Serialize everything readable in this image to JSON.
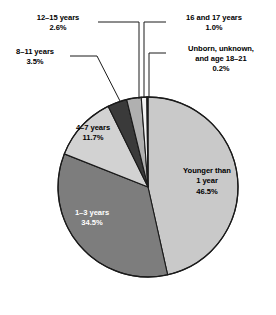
{
  "chart_data": {
    "type": "pie",
    "title": "",
    "subtitle": "",
    "xlabel": "",
    "ylabel": "",
    "legend_position": "none",
    "grid": false,
    "units": "percent",
    "start_angle_deg": 0,
    "direction": "clockwise",
    "categories": [
      "Younger than 1 year",
      "1–3 years",
      "4–7 years",
      "8–11 years",
      "12–15 years",
      "16 and 17 years",
      "Unborn, unknown, and age 18–21"
    ],
    "values": [
      46.5,
      34.5,
      11.7,
      3.5,
      2.6,
      1.0,
      0.2
    ],
    "colors": [
      "#c9c9c9",
      "#7d7d7d",
      "#d2d2d2",
      "#3a3a3a",
      "#b0b0b0",
      "#f2f2f2",
      "#4a4a4a"
    ],
    "slices": [
      {
        "label": "Younger than 1 year",
        "value": 46.5,
        "value_text": "46.5%",
        "color": "#c9c9c9",
        "label_placement": "inside",
        "text_color": "dark"
      },
      {
        "label": "1–3 years",
        "value": 34.5,
        "value_text": "34.5%",
        "color": "#7d7d7d",
        "label_placement": "inside",
        "text_color": "light"
      },
      {
        "label": "4–7 years",
        "value": 11.7,
        "value_text": "11.7%",
        "color": "#d2d2d2",
        "label_placement": "inside",
        "text_color": "dark"
      },
      {
        "label": "8–11 years",
        "value": 3.5,
        "value_text": "3.5%",
        "color": "#3a3a3a",
        "label_placement": "callout",
        "text_color": "dark"
      },
      {
        "label": "12–15 years",
        "value": 2.6,
        "value_text": "2.6%",
        "color": "#b0b0b0",
        "label_placement": "callout",
        "text_color": "dark"
      },
      {
        "label": "16 and 17 years",
        "value": 1.0,
        "value_text": "1.0%",
        "color": "#f2f2f2",
        "label_placement": "callout",
        "text_color": "dark"
      },
      {
        "label": "Unborn, unknown, and age 18–21",
        "value": 0.2,
        "value_text": "0.2%",
        "color": "#4a4a4a",
        "label_placement": "callout",
        "text_color": "dark"
      }
    ]
  },
  "labels": {
    "younger_than_1": {
      "line1": "Younger than",
      "line2": "1 year",
      "pct": "46.5%"
    },
    "age_1_3": {
      "line1": "1–3 years",
      "pct": "34.5%"
    },
    "age_4_7": {
      "line1": "4–7 years",
      "pct": "11.7%"
    },
    "age_8_11": {
      "line1": "8–11 years",
      "pct": "3.5%"
    },
    "age_12_15": {
      "line1": "12–15 years",
      "pct": "2.6%"
    },
    "age_16_17": {
      "line1": "16 and 17 years",
      "pct": "1.0%"
    },
    "unborn": {
      "line1": "Unborn, unknown,",
      "line2": "and age 18–21",
      "pct": "0.2%"
    }
  },
  "style": {
    "outline_color": "#1a1a1a",
    "leader_color": "#1a1a1a",
    "background": "#ffffff"
  }
}
